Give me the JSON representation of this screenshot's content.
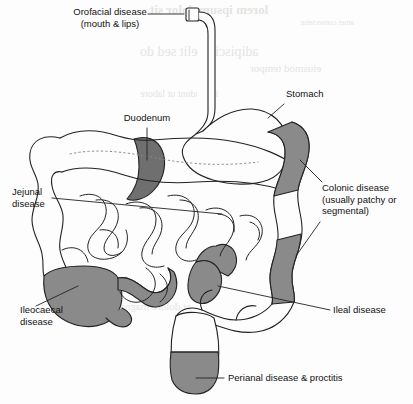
{
  "figure": {
    "background_color": "#fdfdfd",
    "ink_color": "#222222",
    "shade_color": "#8a8a8a",
    "shade_dark_color": "#6f6f6f"
  },
  "labels": {
    "orofacial": "Orofacial disease\n(mouth & lips)",
    "stomach": "Stomach",
    "duodenum": "Duodenum",
    "jejunal": "Jejunal\ndisease",
    "colonic": "Colonic disease\n(usually patchy or\nsegmental)",
    "ileocaecal": "Ileocaecal\ndisease",
    "ileal": "Ileal disease",
    "perianal": "Perianal disease & proctitis"
  },
  "bleed_through": {
    "line1": "lorem ipsum dolor sit",
    "line2": "amet consectetur",
    "line3": "adipiscing elit sed do",
    "line4": "eiusmod tempor",
    "line5": "incididunt ut labore",
    "line6": "et dolore magna"
  }
}
